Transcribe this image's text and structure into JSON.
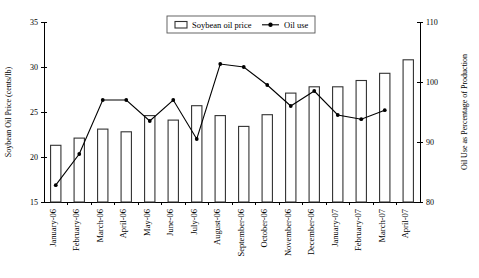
{
  "chart_data": {
    "type": "bar",
    "title": "",
    "categories": [
      "January-06",
      "February-06",
      "March-06",
      "April-06",
      "May-06",
      "June-06",
      "July-06",
      "August-06",
      "September-06",
      "October-06",
      "November-06",
      "December-06",
      "January-07",
      "February-07",
      "March-07",
      "April-07"
    ],
    "series": [
      {
        "name": "Soybean oil price",
        "type": "bar",
        "axis": "left",
        "values": [
          21.3,
          22.1,
          23.1,
          22.8,
          24.6,
          24.1,
          25.7,
          24.6,
          23.4,
          24.7,
          27.1,
          27.8,
          27.8,
          28.5,
          29.3,
          30.8
        ]
      },
      {
        "name": "Oil use",
        "type": "line",
        "axis": "right",
        "values": [
          82.8,
          88.0,
          97.0,
          97.0,
          93.5,
          97.0,
          90.5,
          103.0,
          102.5,
          99.5,
          96.0,
          98.5,
          94.5,
          93.8,
          95.3,
          null
        ]
      }
    ],
    "xlabel": "",
    "ylabel": "Soybean Oil Price (cents/lb)",
    "y2label": "Oil Use as Percentage of Production",
    "ylim": [
      15,
      35
    ],
    "y2lim": [
      80,
      110
    ],
    "yticks": [
      15,
      20,
      25,
      30,
      35
    ],
    "y2ticks": [
      80,
      90,
      100,
      110
    ],
    "grid": false,
    "legend_position": "top-center",
    "legend": [
      "Soybean oil price",
      "Oil use"
    ]
  },
  "axes": {
    "left_title": "Soybean Oil Price (cents/lb)",
    "right_title": "Oil Use as Percentage of Production",
    "left_ticks": [
      "35",
      "30",
      "25",
      "20",
      "15"
    ],
    "right_ticks": [
      "110",
      "100",
      "90",
      "80"
    ]
  },
  "legend": {
    "bar_label": "Soybean oil price",
    "line_label": "Oil use"
  }
}
